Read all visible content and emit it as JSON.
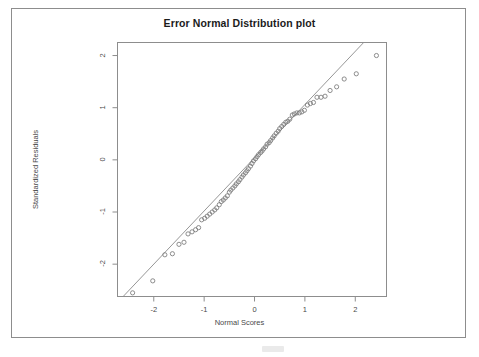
{
  "page": {
    "background": "#ffffff",
    "border_color": "#8d8d8d"
  },
  "chart_data": {
    "type": "scatter",
    "title": "Error Normal Distribution plot",
    "xlabel": "Normal Scores",
    "ylabel": "Standardized Residuals",
    "xlim": [
      -2.72,
      2.62
    ],
    "ylim": [
      -2.62,
      2.25
    ],
    "xticks": [
      -2,
      -1,
      0,
      1,
      2
    ],
    "xtick_labels": [
      "-2",
      "-1",
      "0",
      "1",
      "2"
    ],
    "yticks": [
      -2,
      -1,
      0,
      1,
      2
    ],
    "ytick_labels": [
      "-2",
      "-1",
      "0",
      "1",
      "2"
    ],
    "grid": false,
    "legend": false,
    "marker": "open-circle",
    "marker_color": "#7a7a7a",
    "line_color": "#8a8a8a",
    "reference_line": {
      "label": "qqline",
      "slope": 1.02,
      "intercept": 0.04,
      "x_start": -2.35,
      "y_start": -2.36,
      "x_end": 1.82,
      "y_end": 1.9
    },
    "series": [
      {
        "name": "Standardized Residuals",
        "x": [
          -2.42,
          -2.02,
          -1.78,
          -1.63,
          -1.5,
          -1.4,
          -1.32,
          -1.24,
          -1.17,
          -1.11,
          -1.05,
          -0.99,
          -0.94,
          -0.89,
          -0.84,
          -0.79,
          -0.75,
          -0.7,
          -0.66,
          -0.62,
          -0.58,
          -0.54,
          -0.5,
          -0.47,
          -0.43,
          -0.39,
          -0.36,
          -0.32,
          -0.29,
          -0.25,
          -0.22,
          -0.18,
          -0.15,
          -0.12,
          -0.08,
          -0.05,
          -0.02,
          0.02,
          0.05,
          0.08,
          0.12,
          0.15,
          0.18,
          0.22,
          0.25,
          0.29,
          0.32,
          0.36,
          0.39,
          0.43,
          0.47,
          0.5,
          0.54,
          0.58,
          0.62,
          0.66,
          0.7,
          0.75,
          0.79,
          0.84,
          0.89,
          0.94,
          0.99,
          1.05,
          1.11,
          1.17,
          1.24,
          1.32,
          1.4,
          1.5,
          1.63,
          1.78,
          2.02,
          2.42
        ],
        "y": [
          -2.55,
          -2.32,
          -1.82,
          -1.8,
          -1.62,
          -1.58,
          -1.42,
          -1.38,
          -1.34,
          -1.3,
          -1.15,
          -1.12,
          -1.08,
          -1.04,
          -1.0,
          -0.96,
          -0.92,
          -0.86,
          -0.8,
          -0.77,
          -0.73,
          -0.69,
          -0.62,
          -0.58,
          -0.54,
          -0.5,
          -0.46,
          -0.42,
          -0.38,
          -0.33,
          -0.29,
          -0.25,
          -0.21,
          -0.17,
          -0.12,
          -0.07,
          -0.02,
          0.02,
          0.06,
          0.1,
          0.14,
          0.17,
          0.21,
          0.25,
          0.3,
          0.33,
          0.37,
          0.42,
          0.46,
          0.51,
          0.55,
          0.6,
          0.64,
          0.68,
          0.72,
          0.74,
          0.78,
          0.86,
          0.88,
          0.9,
          0.9,
          0.92,
          0.95,
          1.05,
          1.08,
          1.1,
          1.2,
          1.2,
          1.22,
          1.33,
          1.4,
          1.55,
          1.65,
          2.0
        ]
      }
    ],
    "annotations": []
  }
}
